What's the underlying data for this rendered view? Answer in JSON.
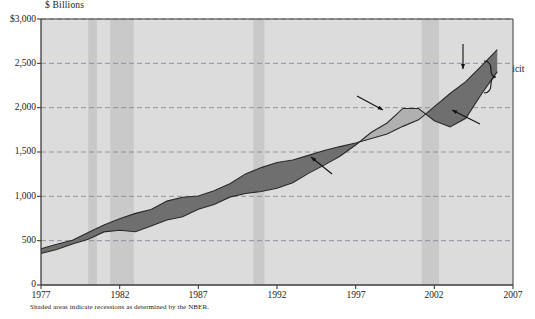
{
  "chart_data": {
    "type": "area",
    "title": "",
    "ylabel": "$ Billions",
    "xlabel": "",
    "ylim": [
      0,
      3000
    ],
    "xlim": [
      1977,
      2007
    ],
    "grid": "horizontal-dashed",
    "legend": "annotations",
    "ytick_labels": [
      "$3,000",
      "2,500",
      "2,000",
      "1,500",
      "1,000",
      "500",
      "0"
    ],
    "ytick_values": [
      3000,
      2500,
      2000,
      1500,
      1000,
      500,
      0
    ],
    "xtick_labels": [
      "1977",
      "1982",
      "1987",
      "1992",
      "1997",
      "2002",
      "2007"
    ],
    "xtick_values": [
      1977,
      1982,
      1987,
      1992,
      1997,
      2002,
      2007
    ],
    "series": [
      {
        "name": "Expenditures",
        "x": [
          1977,
          1978,
          1979,
          1980,
          1981,
          1982,
          1983,
          1984,
          1985,
          1986,
          1987,
          1988,
          1989,
          1990,
          1991,
          1992,
          1993,
          1994,
          1995,
          1996,
          1997,
          1998,
          1999,
          2000,
          2001,
          2002,
          2003,
          2004,
          2005,
          2006
        ],
        "values": [
          409,
          459,
          504,
          591,
          678,
          746,
          808,
          852,
          946,
          990,
          1004,
          1064,
          1143,
          1253,
          1324,
          1382,
          1409,
          1462,
          1516,
          1561,
          1601,
          1653,
          1702,
          1789,
          1863,
          2011,
          2160,
          2293,
          2472,
          2655
        ]
      },
      {
        "name": "Receipts",
        "x": [
          1977,
          1978,
          1979,
          1980,
          1981,
          1982,
          1983,
          1984,
          1985,
          1986,
          1987,
          1988,
          1989,
          1990,
          1991,
          1992,
          1993,
          1994,
          1995,
          1996,
          1997,
          1998,
          1999,
          2000,
          2001,
          2002,
          2003,
          2004,
          2005,
          2006
        ],
        "values": [
          356,
          400,
          463,
          517,
          599,
          618,
          601,
          666,
          734,
          769,
          854,
          909,
          991,
          1032,
          1055,
          1091,
          1154,
          1259,
          1352,
          1453,
          1579,
          1722,
          1827,
          1991,
          1991,
          1853,
          1782,
          1880,
          2154,
          2407
        ]
      }
    ],
    "annotations": [
      {
        "label": "Expenditures",
        "pointer": "arrow-down"
      },
      {
        "label": "Receipts",
        "pointer": "arrow-up-left"
      },
      {
        "label": "Surplus",
        "pointer": "arrow-down-right"
      },
      {
        "label": "Deficit",
        "pointer": "arrow-up-left"
      },
      {
        "label": "Deficit",
        "pointer": "curly-brace"
      }
    ],
    "recession_bands": [
      {
        "start": 1980.0,
        "end": 1980.55
      },
      {
        "start": 1981.4,
        "end": 1982.9
      },
      {
        "start": 1990.5,
        "end": 1991.2
      },
      {
        "start": 2001.2,
        "end": 2002.3
      }
    ],
    "colors": {
      "deficit_fill": "#6f6f6f",
      "surplus_fill": "#b0b0b0",
      "plot_background": "#dcdcdc",
      "recession_band": "#c9c9c9",
      "gridline": "#8a8a99",
      "axis": "#3c3c3c"
    }
  },
  "footnote": "Shaded areas indicate recessions as determined by the NBER."
}
